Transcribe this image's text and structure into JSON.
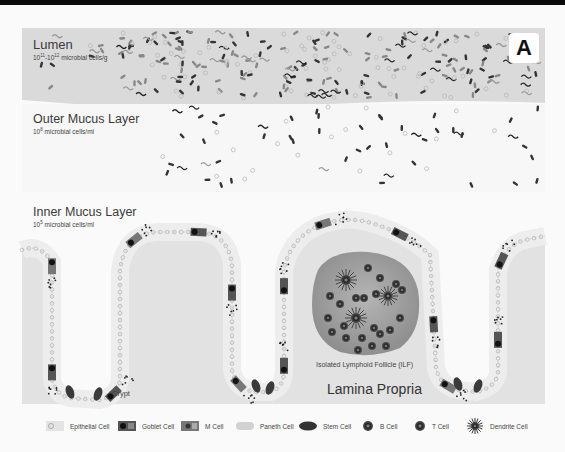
{
  "panel_label": "A",
  "layers": {
    "lumen": {
      "title": "Lumen",
      "subtitle_base": "10",
      "subtitle_exp1": "11",
      "subtitle_mid": "-10",
      "subtitle_exp2": "12",
      "subtitle_unit": " microbial cells/g"
    },
    "outer_mucus": {
      "title": "Outer Mucus Layer",
      "subtitle_base": "10",
      "subtitle_exp": "8",
      "subtitle_unit": " microbial cells/ml"
    },
    "inner_mucus": {
      "title": "Inner Mucus Layer",
      "subtitle_base": "10",
      "subtitle_exp": "5",
      "subtitle_unit": " microbial cells/ml"
    }
  },
  "annotations": {
    "crypt": "Crypt",
    "ilf": "Isolated Lymphoid Follicle (ILF)",
    "lamina_propria": "Lamina Propria"
  },
  "legend": [
    {
      "icon": "epithelial-cell-icon",
      "label": "Epithelial Cell"
    },
    {
      "icon": "goblet-cell-icon",
      "label": "Goblet Cell"
    },
    {
      "icon": "m-cell-icon",
      "label": "M Cell"
    },
    {
      "icon": "paneth-cell-icon",
      "label": "Paneth Cell"
    },
    {
      "icon": "stem-cell-icon",
      "label": "Stem Cell"
    },
    {
      "icon": "b-cell-icon",
      "label": "B Cell"
    },
    {
      "icon": "t-cell-icon",
      "label": "T Cell"
    },
    {
      "icon": "dendrite-cell-icon",
      "label": "Dendrite Cell"
    }
  ],
  "colors": {
    "lumen_band": "#d9d9d9",
    "tissue": "#e4e4e4",
    "epithelium": "#ececec",
    "follicle": "#9c9c9c",
    "dark_cell": "#3a3a3a"
  }
}
